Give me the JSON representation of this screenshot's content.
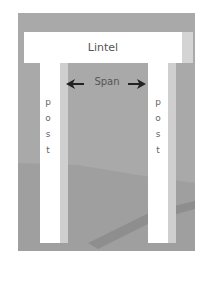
{
  "diagram": {
    "labels": {
      "lintel": "Lintel",
      "span": "Span",
      "left_post": [
        "p",
        "o",
        "s",
        "t"
      ],
      "right_post": [
        "p",
        "o",
        "s",
        "t"
      ]
    },
    "colors": {
      "background": "#a9a9a9",
      "element": "#ffffff",
      "element_side": "#d0d0d0",
      "text": "#555555",
      "arrow": "#222222"
    }
  }
}
